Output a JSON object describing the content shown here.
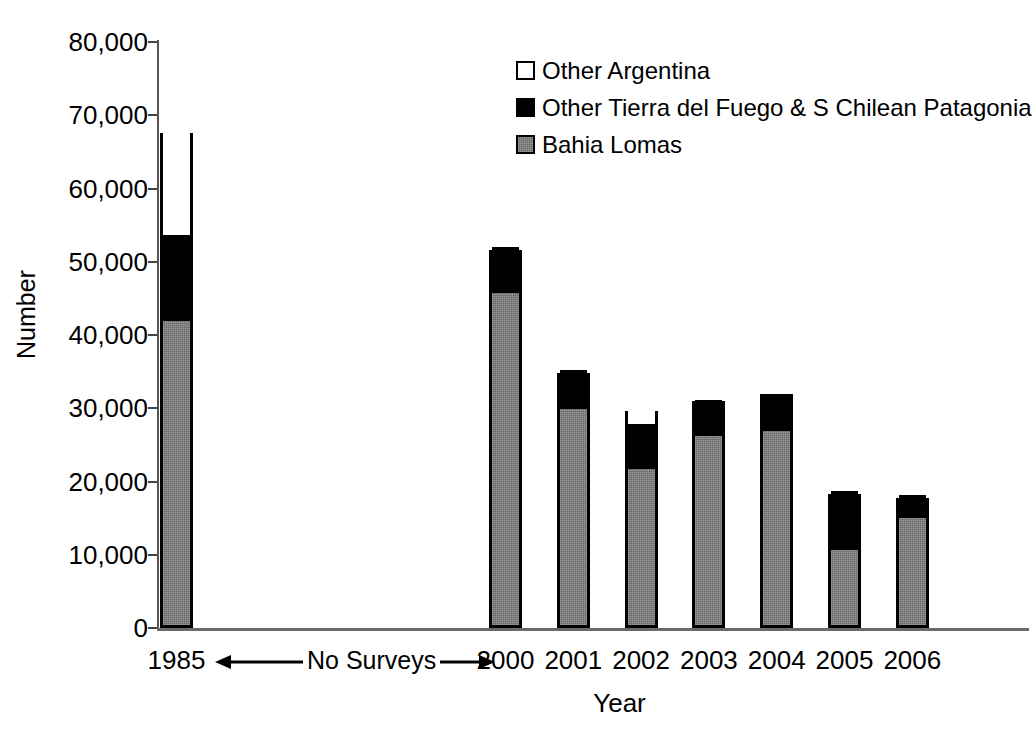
{
  "chart_data": {
    "type": "bar",
    "subtype": "stacked",
    "title": "",
    "xlabel": "Year",
    "ylabel": "Number",
    "ylim": [
      0,
      80000
    ],
    "ytick_values": [
      80000,
      70000,
      60000,
      50000,
      40000,
      30000,
      20000,
      10000,
      0
    ],
    "ytick_labels": [
      "80,000",
      "70,000",
      "60,000",
      "50,000",
      "40,000",
      "30,000",
      "20,000",
      "10,000",
      "0"
    ],
    "categories": [
      "1985",
      "2000",
      "2001",
      "2002",
      "2003",
      "2004",
      "2005",
      "2006"
    ],
    "grid": false,
    "legend_position": "top-right",
    "series": [
      {
        "name": "Bahia Lomas",
        "color": "#808080",
        "swatch": "gray",
        "values": [
          41500,
          45300,
          29500,
          21300,
          25800,
          26500,
          10200,
          14600
        ]
      },
      {
        "name": "Other Tierra del Fuego & S Chilean Patagonia",
        "color": "#000000",
        "swatch": "black",
        "values": [
          11800,
          6300,
          5300,
          6100,
          4900,
          5100,
          8100,
          3200
        ]
      },
      {
        "name": "Other Argentina",
        "color": "#ffffff",
        "swatch": "white",
        "values": [
          14300,
          0,
          0,
          2200,
          300,
          400,
          0,
          0
        ]
      }
    ],
    "totals": [
      67600,
      51600,
      34800,
      29800,
      31000,
      32000,
      18300,
      17800
    ],
    "annotations": [
      {
        "text": "No Surveys",
        "type": "double-arrow",
        "from_category": "1985",
        "to_category": "2000",
        "axis": "x"
      }
    ]
  },
  "legend": {
    "items": [
      {
        "label": "Other Argentina",
        "swatch": "white"
      },
      {
        "label": "Other Tierra del Fuego & S Chilean Patagonia",
        "swatch": "black"
      },
      {
        "label": "Bahia Lomas",
        "swatch": "gray"
      }
    ]
  },
  "axes": {
    "y_title": "Number",
    "x_title": "Year"
  },
  "annotation": {
    "no_surveys": "No Surveys"
  }
}
